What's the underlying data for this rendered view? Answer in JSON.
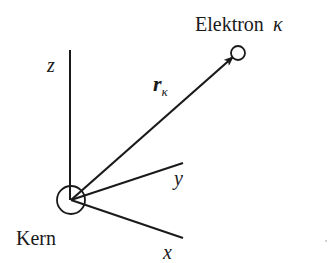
{
  "diagram": {
    "type": "coordinate-system",
    "labels": {
      "electron": "Elektron",
      "electron_index": "κ",
      "nucleus": "Kern",
      "vector": "r",
      "vector_sub": "κ",
      "axis_z": "z",
      "axis_y": "y",
      "axis_x": "x"
    },
    "colors": {
      "stroke": "#1a1a1a",
      "background": "#ffffff"
    }
  }
}
